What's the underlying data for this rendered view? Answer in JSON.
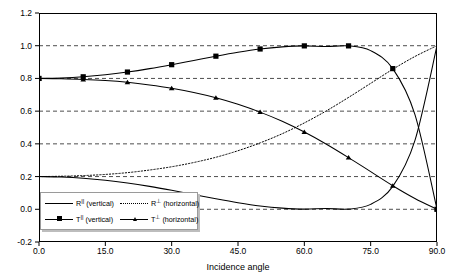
{
  "chart_data": {
    "type": "line",
    "title": "",
    "xlabel": "Incidence angle",
    "ylabel": "Power fraction",
    "xlim": [
      0,
      90
    ],
    "ylim": [
      -0.2,
      1.2
    ],
    "xticks": [
      "0.0",
      "15.0",
      "30.0",
      "45.0",
      "60.0",
      "75.0",
      "90.0"
    ],
    "xtick_values": [
      0,
      15,
      30,
      45,
      60,
      75,
      90
    ],
    "yticks": [
      "-0.2",
      "0.0",
      "0.2",
      "0.4",
      "0.6",
      "0.8",
      "1.0",
      "1.2"
    ],
    "ytick_values": [
      -0.2,
      0.0,
      0.2,
      0.4,
      0.6,
      0.8,
      1.0,
      1.2
    ],
    "grid": "horizontal-dashed",
    "legend_position": "lower-left-inside",
    "x": [
      0,
      5,
      10,
      15,
      20,
      25,
      30,
      35,
      40,
      45,
      50,
      55,
      60,
      65,
      70,
      75,
      80,
      85,
      90
    ],
    "series": [
      {
        "name": "R|| (vertical)",
        "label_base": "R",
        "label_sup": "||",
        "label_suffix": "(vertical)",
        "style": "solid",
        "marker": "none",
        "color": "#000000",
        "values": [
          0.2,
          0.197,
          0.19,
          0.178,
          0.161,
          0.14,
          0.116,
          0.09,
          0.064,
          0.04,
          0.02,
          0.007,
          0.001,
          0.005,
          0.001,
          0.03,
          0.14,
          0.42,
          1.0
        ]
      },
      {
        "name": "R (horizontal)",
        "label_base": "R",
        "label_sup": "⊥",
        "label_suffix": "(horizontal)",
        "style": "dotted",
        "marker": "none",
        "color": "#000000",
        "values": [
          0.2,
          0.202,
          0.206,
          0.213,
          0.224,
          0.24,
          0.26,
          0.286,
          0.318,
          0.358,
          0.406,
          0.462,
          0.528,
          0.602,
          0.684,
          0.77,
          0.856,
          0.934,
          1.0
        ]
      },
      {
        "name": "T|| (vertical)",
        "label_base": "T",
        "label_sup": "||",
        "label_suffix": "(vertical)",
        "style": "solid",
        "marker": "square",
        "color": "#000000",
        "values": [
          0.8,
          0.803,
          0.81,
          0.822,
          0.839,
          0.86,
          0.884,
          0.91,
          0.936,
          0.96,
          0.98,
          0.993,
          0.999,
          0.995,
          0.999,
          0.97,
          0.86,
          0.58,
          0.0
        ]
      },
      {
        "name": "T (horizontal)",
        "label_base": "T",
        "label_sup": "⊥",
        "label_suffix": "(horizontal)",
        "style": "solid",
        "marker": "triangle",
        "color": "#000000",
        "values": [
          0.8,
          0.798,
          0.794,
          0.787,
          0.776,
          0.76,
          0.74,
          0.714,
          0.682,
          0.642,
          0.594,
          0.538,
          0.472,
          0.398,
          0.316,
          0.23,
          0.144,
          0.066,
          0.0
        ]
      }
    ],
    "marker_x": [
      0,
      10,
      20,
      30,
      40,
      50,
      60,
      70,
      80,
      90
    ]
  }
}
